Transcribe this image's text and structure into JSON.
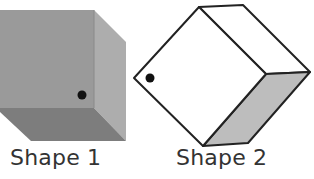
{
  "shapes": [
    {
      "label": "Shape 1",
      "style": "solid shaded cube",
      "colors": {
        "front": "#9a9a9a",
        "right": "#aeaeae",
        "bottom": "#7c7c7c",
        "dot": "#111111"
      }
    },
    {
      "label": "Shape 2",
      "style": "outlined rotated cube",
      "colors": {
        "front": "#ffffff",
        "top": "#ffffff",
        "side": "#bcbcbc",
        "stroke": "#222222",
        "dot": "#111111"
      }
    }
  ]
}
